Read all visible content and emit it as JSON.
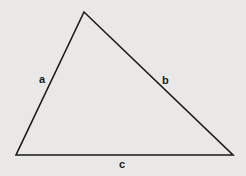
{
  "diagram": {
    "type": "triangle",
    "background": "#e9e8e6",
    "stroke": "#1a1a1a",
    "vertices": {
      "top": [
        84,
        12
      ],
      "bottom_left": [
        16,
        155
      ],
      "bottom_right": [
        233,
        155
      ]
    },
    "labels": {
      "a": "a",
      "b": "b",
      "c": "c"
    }
  }
}
